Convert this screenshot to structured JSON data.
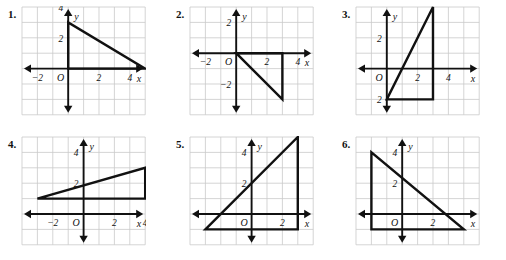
{
  "page": {
    "background_color": "#ffffff",
    "ink_color": "#111111",
    "grid_line_color": "#c9c9c9",
    "figure_stroke_color": "#111111"
  },
  "layout": {
    "columns": 3,
    "rows": 2,
    "cell_size_px": 15.4
  },
  "labels": {
    "x_axis": "x",
    "y_axis": "y",
    "origin": "O",
    "neg_two": "−2",
    "two": "2",
    "four": "4",
    "neg_two_y": "−2",
    "two_y": "2",
    "four_y": "4"
  },
  "chart_data": [
    {
      "type": "scatter",
      "title": "1.",
      "number": "1.",
      "xlabel": "x",
      "ylabel": "y",
      "xlim": [
        -3,
        5
      ],
      "ylim": [
        -3,
        4
      ],
      "grid": true,
      "x_ticks": [
        -2,
        2,
        4
      ],
      "x_tick_labels": [
        "−2",
        "2",
        "4"
      ],
      "y_ticks": [
        2,
        4
      ],
      "y_tick_labels": [
        "2",
        "4"
      ],
      "origin_label": "O",
      "shape": "triangle",
      "vertices": [
        [
          0,
          0
        ],
        [
          0,
          3
        ],
        [
          5,
          0
        ]
      ]
    },
    {
      "type": "scatter",
      "title": "2.",
      "number": "2.",
      "xlabel": "x",
      "ylabel": "y",
      "xlim": [
        -3,
        5
      ],
      "ylim": [
        -4,
        3
      ],
      "grid": true,
      "x_ticks": [
        -2,
        2,
        4
      ],
      "x_tick_labels": [
        "−2",
        "2",
        "4"
      ],
      "y_ticks": [
        -2,
        2
      ],
      "y_tick_labels": [
        "−2",
        "2"
      ],
      "origin_label": "O",
      "shape": "triangle",
      "vertices": [
        [
          0,
          0
        ],
        [
          3,
          0
        ],
        [
          3,
          -3
        ]
      ]
    },
    {
      "type": "scatter",
      "title": "3.",
      "number": "3.",
      "xlabel": "x",
      "ylabel": "y",
      "xlim": [
        -2,
        6
      ],
      "ylim": [
        -3,
        4
      ],
      "grid": true,
      "x_ticks": [
        2,
        4
      ],
      "x_tick_labels": [
        "2",
        "4"
      ],
      "y_ticks": [
        -2,
        2
      ],
      "y_tick_labels": [
        "2",
        "2"
      ],
      "origin_label": "O",
      "shape": "triangle",
      "vertices": [
        [
          0,
          -2
        ],
        [
          3,
          -2
        ],
        [
          3,
          4
        ]
      ]
    },
    {
      "type": "scatter",
      "title": "4.",
      "number": "4.",
      "xlabel": "x",
      "ylabel": "y",
      "xlim": [
        -4,
        5
      ],
      "ylim": [
        -2,
        5
      ],
      "grid": true,
      "x_ticks": [
        -2,
        2,
        4
      ],
      "x_tick_labels": [
        "−2",
        "2",
        "4"
      ],
      "y_ticks": [
        2,
        4
      ],
      "y_tick_labels": [
        "2",
        "4"
      ],
      "origin_label": "O",
      "shape": "triangle",
      "vertices": [
        [
          -3,
          1
        ],
        [
          4,
          1
        ],
        [
          4,
          3
        ]
      ]
    },
    {
      "type": "scatter",
      "title": "5.",
      "number": "5.",
      "xlabel": "x",
      "ylabel": "y",
      "xlim": [
        -4,
        4
      ],
      "ylim": [
        -2,
        5
      ],
      "grid": true,
      "x_ticks": [
        2
      ],
      "x_tick_labels": [
        "2"
      ],
      "y_ticks": [
        2,
        4
      ],
      "y_tick_labels": [
        "2",
        "4"
      ],
      "origin_label": "O",
      "shape": "triangle",
      "vertices": [
        [
          -3,
          -1
        ],
        [
          3,
          -1
        ],
        [
          3,
          5
        ]
      ]
    },
    {
      "type": "scatter",
      "title": "6.",
      "number": "6.",
      "xlabel": "x",
      "ylabel": "y",
      "xlim": [
        -3,
        5
      ],
      "ylim": [
        -2,
        5
      ],
      "grid": true,
      "x_ticks": [
        2
      ],
      "x_tick_labels": [
        "2"
      ],
      "y_ticks": [
        2,
        4
      ],
      "y_tick_labels": [
        "2",
        "4"
      ],
      "origin_label": "O",
      "shape": "triangle",
      "vertices": [
        [
          -2,
          -1
        ],
        [
          -2,
          4
        ],
        [
          4,
          -1
        ]
      ]
    }
  ]
}
